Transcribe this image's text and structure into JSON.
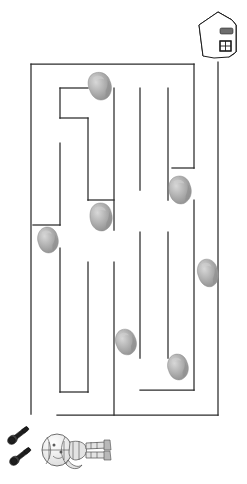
{
  "page": {
    "title": "Maze Puzzle Worksheet",
    "description": "Black-and-white printable maze puzzle on white paper",
    "width": 247,
    "height": 484,
    "background_color": "#ffffff",
    "line_color": "#2b2b2b"
  },
  "maze": {
    "name": "rectangular-maze",
    "bounds": {
      "x": 31,
      "y": 64,
      "right": 218,
      "bottom": 415
    },
    "entrance": {
      "name": "maze-entrance",
      "side": "bottom-left",
      "x_from": 33,
      "x_to": 57,
      "y": 415
    },
    "exit": {
      "name": "maze-exit",
      "side": "top-right",
      "x": 218,
      "y": 62
    },
    "outer_walls": [
      {
        "name": "outer-wall-top",
        "x1": 31,
        "y1": 64,
        "x2": 194,
        "y2": 64
      },
      {
        "name": "outer-wall-left",
        "x1": 31,
        "y1": 64,
        "x2": 31,
        "y2": 414
      },
      {
        "name": "outer-wall-bottom",
        "x1": 57,
        "y1": 415,
        "x2": 218,
        "y2": 415
      },
      {
        "name": "outer-wall-right-upper",
        "x1": 194,
        "y1": 64,
        "x2": 194,
        "y2": 168
      },
      {
        "name": "outer-wall-right-jog",
        "x1": 172,
        "y1": 168,
        "x2": 194,
        "y2": 168
      },
      {
        "name": "outer-wall-right-corridor",
        "x1": 218,
        "y1": 62,
        "x2": 218,
        "y2": 415
      }
    ],
    "inner_walls": [
      {
        "name": "wall-top-left-hook-v",
        "x1": 60,
        "y1": 88,
        "x2": 60,
        "y2": 118
      },
      {
        "name": "wall-top-left-hook-h",
        "x1": 60,
        "y1": 88,
        "x2": 88,
        "y2": 88
      },
      {
        "name": "wall-left-step-h",
        "x1": 60,
        "y1": 118,
        "x2": 88,
        "y2": 118
      },
      {
        "name": "wall-left-step-v",
        "x1": 88,
        "y1": 118,
        "x2": 88,
        "y2": 200
      },
      {
        "name": "wall-left-mid-v",
        "x1": 60,
        "y1": 143,
        "x2": 60,
        "y2": 225
      },
      {
        "name": "wall-left-mid-h",
        "x1": 33,
        "y1": 225,
        "x2": 60,
        "y2": 225
      },
      {
        "name": "wall-left-long-v",
        "x1": 60,
        "y1": 248,
        "x2": 60,
        "y2": 392
      },
      {
        "name": "wall-left-long-h",
        "x1": 60,
        "y1": 392,
        "x2": 88,
        "y2": 392
      },
      {
        "name": "wall-left-long-v2",
        "x1": 88,
        "y1": 262,
        "x2": 88,
        "y2": 392
      },
      {
        "name": "wall-mid-shelf-h",
        "x1": 88,
        "y1": 200,
        "x2": 114,
        "y2": 200
      },
      {
        "name": "wall-center-v-upper",
        "x1": 114,
        "y1": 88,
        "x2": 114,
        "y2": 230
      },
      {
        "name": "wall-center-v-lower",
        "x1": 114,
        "y1": 262,
        "x2": 114,
        "y2": 415
      },
      {
        "name": "wall-center2-v",
        "x1": 140,
        "y1": 88,
        "x2": 140,
        "y2": 190
      },
      {
        "name": "wall-center3-v",
        "x1": 140,
        "y1": 232,
        "x2": 140,
        "y2": 358
      },
      {
        "name": "wall-right-inner-v",
        "x1": 168,
        "y1": 88,
        "x2": 168,
        "y2": 200
      },
      {
        "name": "wall-right-inner2-v",
        "x1": 168,
        "y1": 232,
        "x2": 168,
        "y2": 358
      },
      {
        "name": "wall-right-bottom-h",
        "x1": 140,
        "y1": 390,
        "x2": 194,
        "y2": 390
      },
      {
        "name": "wall-right-bottom-v",
        "x1": 194,
        "y1": 200,
        "x2": 194,
        "y2": 390
      }
    ],
    "rocks": [
      {
        "name": "rock-1",
        "cx": 100,
        "cy": 86,
        "rx": 11,
        "ry": 14,
        "rot": -18
      },
      {
        "name": "rock-2",
        "cx": 48,
        "cy": 240,
        "rx": 10,
        "ry": 13,
        "rot": -14
      },
      {
        "name": "rock-3",
        "cx": 101,
        "cy": 217,
        "rx": 11,
        "ry": 14,
        "rot": -12
      },
      {
        "name": "rock-4",
        "cx": 180,
        "cy": 190,
        "rx": 11,
        "ry": 14,
        "rot": -16
      },
      {
        "name": "rock-5",
        "cx": 208,
        "cy": 273,
        "rx": 10,
        "ry": 14,
        "rot": -16
      },
      {
        "name": "rock-6",
        "cx": 126,
        "cy": 342,
        "rx": 10,
        "ry": 13,
        "rot": -20
      },
      {
        "name": "rock-7",
        "cx": 178,
        "cy": 367,
        "rx": 10,
        "ry": 13,
        "rot": -16
      }
    ]
  },
  "house": {
    "name": "house-goal-icon",
    "label": "house",
    "x": 196,
    "y": 10,
    "width": 44,
    "height": 52,
    "shade_color": "#3a3a3a",
    "face_color": "#ffffff",
    "parts": [
      "roof",
      "dark-side-wall",
      "front-wall",
      "mail-slot",
      "window"
    ]
  },
  "start_objects": {
    "name": "start-scene",
    "items": [
      {
        "name": "bolt-icon-1",
        "label": "bolt",
        "x": 5,
        "y": 425
      },
      {
        "name": "bolt-icon-2",
        "label": "bolt",
        "x": 8,
        "y": 445
      },
      {
        "name": "figure-icon",
        "label": "toy figure",
        "x": 38,
        "y": 428
      }
    ]
  }
}
